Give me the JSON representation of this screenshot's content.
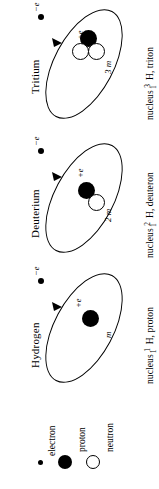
{
  "diagram": {
    "title_implied": "Hydrogen isotopes: atomic structure",
    "panels": [
      {
        "key": "tritium",
        "title": "Tritium",
        "nucleus_label_prefix": "nucleus",
        "isotope_mass_number": "3",
        "isotope_atomic_number": "1",
        "isotope_symbol": "H,",
        "nucleus_name": "triton",
        "electron_charge_label": "−e",
        "nucleus_charge_label": "+e",
        "nucleus_mass_label": "3 m",
        "proton_count": 1,
        "neutron_count": 2,
        "electron_count": 1
      },
      {
        "key": "deuterium",
        "title": "Deuterium",
        "nucleus_label_prefix": "nucleus",
        "isotope_mass_number": "2",
        "isotope_atomic_number": "1",
        "isotope_symbol": "H,",
        "nucleus_name": "deuteron",
        "electron_charge_label": "−e",
        "nucleus_charge_label": "+e",
        "nucleus_mass_label": "2 m",
        "proton_count": 1,
        "neutron_count": 1,
        "electron_count": 1
      },
      {
        "key": "hydrogen",
        "title": "Hydrogen",
        "nucleus_label_prefix": "nucleus",
        "isotope_mass_number": "1",
        "isotope_atomic_number": "1",
        "isotope_symbol": "H,",
        "nucleus_name": "proton",
        "electron_charge_label": "−e",
        "nucleus_charge_label": "+e",
        "nucleus_mass_label": "m",
        "proton_count": 1,
        "neutron_count": 0,
        "electron_count": 1
      }
    ],
    "legend": {
      "items": [
        {
          "key": "electron",
          "label": "electron",
          "marker": "small-filled-dot"
        },
        {
          "key": "proton",
          "label": "proton",
          "marker": "large-filled-circle"
        },
        {
          "key": "neutron",
          "label": "neutron",
          "marker": "large-open-circle"
        }
      ]
    },
    "colors": {
      "ink": "#000000",
      "background": "#ffffff"
    }
  }
}
